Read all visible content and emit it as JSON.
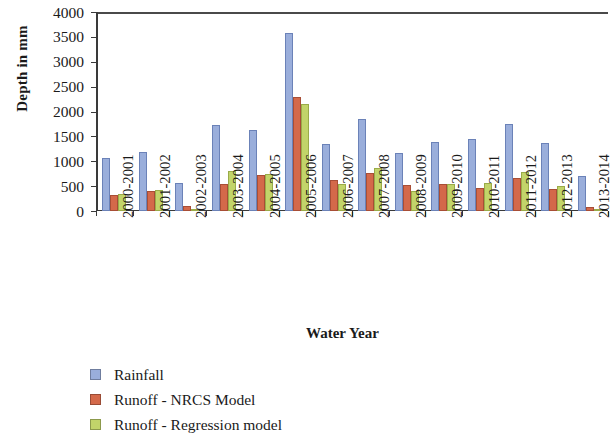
{
  "chart_data": {
    "type": "bar",
    "title": "",
    "xlabel": "Water Year",
    "ylabel": "Depth in mm",
    "ylim": [
      0,
      4000
    ],
    "yticks": [
      0,
      500,
      1000,
      1500,
      2000,
      2500,
      3000,
      3500,
      4000
    ],
    "ytick_labels": [
      "0",
      "500",
      "1000",
      "1500",
      "2000",
      "2500",
      "3000",
      "3500",
      "4000"
    ],
    "grid": false,
    "legend_position": "bottom-left",
    "categories": [
      "2000-2001",
      "2001-2002",
      "2002-2003",
      "2003-2004",
      "2004-2005",
      "2005-2006",
      "2006-2007",
      "2007-2008",
      "2008-2009",
      "2009-2010",
      "2010-2011",
      "2011-2012",
      "2012-2013",
      "2013-2014"
    ],
    "series": [
      {
        "name": "Rainfall",
        "color": "#9aaedb",
        "values": [
          1070,
          1180,
          560,
          1730,
          1620,
          3580,
          1340,
          1850,
          1170,
          1390,
          1440,
          1740,
          1370,
          700
        ]
      },
      {
        "name": "Runoff - NRCS Model",
        "color": "#d4694a",
        "values": [
          330,
          400,
          100,
          540,
          720,
          2300,
          620,
          760,
          520,
          540,
          470,
          670,
          440,
          90
        ]
      },
      {
        "name": "Runoff - Regression model",
        "color": "#c2d46a",
        "values": [
          340,
          420,
          20,
          800,
          740,
          2150,
          540,
          860,
          400,
          540,
          560,
          790,
          500,
          30
        ]
      }
    ]
  },
  "axes": {
    "y_title": "Depth in mm",
    "x_title": "Water Year"
  },
  "legend": {
    "items": [
      {
        "label": "Rainfall",
        "color": "#9aaedb"
      },
      {
        "label": "Runoff - NRCS Model",
        "color": "#d4694a"
      },
      {
        "label": "Runoff - Regression model",
        "color": "#c2d46a"
      }
    ]
  }
}
